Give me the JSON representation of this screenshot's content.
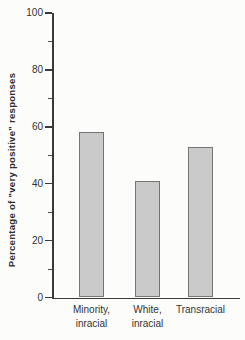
{
  "figure": {
    "background": "#fcfcfa",
    "axis_color": "#3a3a3a",
    "text_color": "#333333",
    "bar_fill": "#cacaca",
    "bar_border": "#757575"
  },
  "chart_data": {
    "type": "bar",
    "title": "",
    "xlabel": "",
    "ylabel": "Percentage of \"very positive\" responses",
    "categories": [
      "Minority,\ninracial",
      "White,\ninracial",
      "Transracial"
    ],
    "values": [
      58,
      41,
      53
    ],
    "ylim": [
      0,
      100
    ],
    "yticks_major": [
      0,
      20,
      40,
      60,
      80,
      100
    ],
    "ytick_minor_step": 10,
    "grid": false,
    "legend": "none"
  }
}
